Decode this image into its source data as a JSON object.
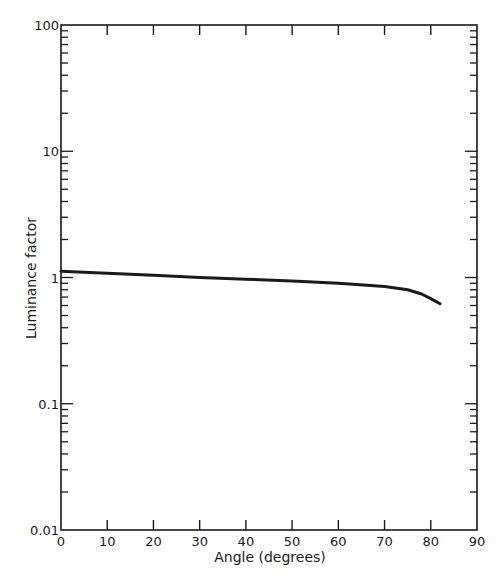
{
  "chart_data": {
    "type": "line",
    "title": "",
    "xlabel": "Angle (degrees)",
    "ylabel": "Luminance factor",
    "xlim": [
      0,
      90
    ],
    "ylim": [
      0.01,
      100
    ],
    "yscale": "log",
    "x_ticks": [
      0,
      10,
      20,
      30,
      40,
      50,
      60,
      70,
      80,
      90
    ],
    "x_tick_labels": [
      "0",
      "10",
      "20",
      "30",
      "40",
      "50",
      "60",
      "70",
      "80",
      "90"
    ],
    "y_ticks": [
      0.01,
      0.1,
      1,
      10,
      100
    ],
    "y_tick_labels": [
      "0.01",
      "0.1",
      "1",
      "10",
      "100"
    ],
    "grid": false,
    "legend": null,
    "series": [
      {
        "name": "Luminance factor",
        "x": [
          0,
          10,
          20,
          30,
          40,
          50,
          60,
          70,
          75,
          78,
          80,
          82
        ],
        "y": [
          1.12,
          1.08,
          1.04,
          1.0,
          0.97,
          0.94,
          0.9,
          0.85,
          0.8,
          0.74,
          0.68,
          0.62
        ]
      }
    ]
  },
  "colors": {
    "ink": "#1a1a1a",
    "background": "#ffffff"
  }
}
